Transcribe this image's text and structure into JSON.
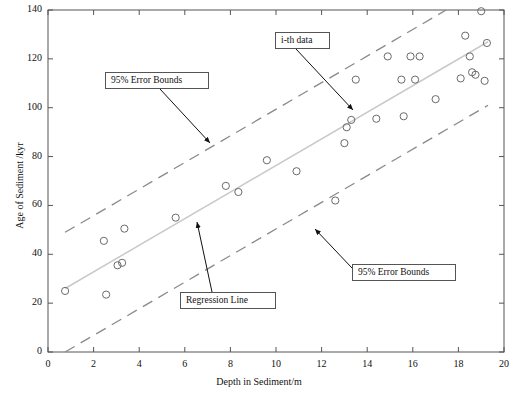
{
  "chart_data": {
    "type": "scatter",
    "title": "",
    "xlabel": "Depth in Sediment/m",
    "ylabel": "Age of Sediment /kyr",
    "xlim": [
      0,
      20
    ],
    "ylim": [
      0,
      140
    ],
    "xticks": [
      0,
      2,
      4,
      6,
      8,
      10,
      12,
      14,
      16,
      18,
      20
    ],
    "yticks": [
      0,
      20,
      40,
      60,
      80,
      100,
      120,
      140
    ],
    "grid": false,
    "legend_position": "none",
    "marker": "open-circle",
    "points": [
      {
        "x": 0.75,
        "y": 25.0
      },
      {
        "x": 2.45,
        "y": 45.5
      },
      {
        "x": 2.55,
        "y": 23.5
      },
      {
        "x": 3.05,
        "y": 35.5
      },
      {
        "x": 3.25,
        "y": 36.5
      },
      {
        "x": 3.35,
        "y": 50.5
      },
      {
        "x": 5.6,
        "y": 55.0
      },
      {
        "x": 7.8,
        "y": 68.0
      },
      {
        "x": 8.35,
        "y": 65.5
      },
      {
        "x": 9.6,
        "y": 78.5
      },
      {
        "x": 10.9,
        "y": 74.0
      },
      {
        "x": 12.6,
        "y": 62.0
      },
      {
        "x": 13.0,
        "y": 85.5
      },
      {
        "x": 13.1,
        "y": 92.0
      },
      {
        "x": 13.3,
        "y": 95.0
      },
      {
        "x": 13.5,
        "y": 111.5
      },
      {
        "x": 14.4,
        "y": 95.5
      },
      {
        "x": 14.9,
        "y": 121.0
      },
      {
        "x": 15.5,
        "y": 111.5
      },
      {
        "x": 15.6,
        "y": 96.5
      },
      {
        "x": 15.9,
        "y": 121.0
      },
      {
        "x": 16.1,
        "y": 111.5
      },
      {
        "x": 16.3,
        "y": 121.0
      },
      {
        "x": 17.0,
        "y": 103.5
      },
      {
        "x": 18.1,
        "y": 112.0
      },
      {
        "x": 18.3,
        "y": 129.5
      },
      {
        "x": 18.5,
        "y": 121.0
      },
      {
        "x": 18.6,
        "y": 114.5
      },
      {
        "x": 18.75,
        "y": 113.5
      },
      {
        "x": 19.0,
        "y": 139.5
      },
      {
        "x": 19.15,
        "y": 111.0
      },
      {
        "x": 19.25,
        "y": 126.5
      }
    ],
    "series": [
      {
        "name": "Regression Line",
        "style": "solid",
        "color": "#c9c9c9",
        "x": [
          0.75,
          19.3
        ],
        "y": [
          26.0,
          127.0
        ]
      },
      {
        "name": "95% Error Bounds Upper",
        "style": "dashed",
        "color": "#8a8a8a",
        "x": [
          0.75,
          19.3
        ],
        "y": [
          49.0,
          150.0
        ]
      },
      {
        "name": "95% Error Bounds Lower",
        "style": "dashed",
        "color": "#8a8a8a",
        "x": [
          0.75,
          19.3
        ],
        "y": [
          0.0,
          101.0
        ]
      }
    ],
    "annotations": [
      {
        "id": "upper-bounds",
        "label": "95% Error Bounds",
        "box_x": 105,
        "box_y": 72,
        "box_w": 104,
        "box_h": 17,
        "arrow_from_x": 160,
        "arrow_from_y": 89,
        "arrow_to_x": 210,
        "arrow_to_y": 143
      },
      {
        "id": "i-th-data",
        "label": "i-th data",
        "box_x": 275,
        "box_y": 32,
        "box_w": 55,
        "box_h": 17,
        "arrow_from_x": 296,
        "arrow_from_y": 49,
        "arrow_to_x": 353,
        "arrow_to_y": 110
      },
      {
        "id": "regression-line",
        "label": "Regression Line",
        "box_x": 180,
        "box_y": 292,
        "box_w": 96,
        "box_h": 17,
        "arrow_from_x": 212,
        "arrow_from_y": 292,
        "arrow_to_x": 197,
        "arrow_to_y": 222
      },
      {
        "id": "lower-bounds",
        "label": "95% Error Bounds",
        "box_x": 352,
        "box_y": 264,
        "box_w": 104,
        "box_h": 17,
        "arrow_from_x": 352,
        "arrow_from_y": 268,
        "arrow_to_x": 315,
        "arrow_to_y": 229
      }
    ]
  }
}
